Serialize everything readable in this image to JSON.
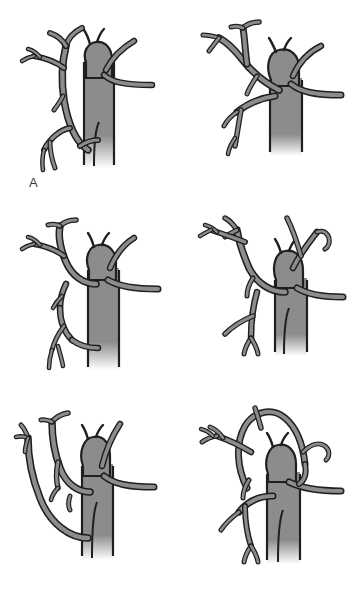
{
  "figure": {
    "background_color": "#ffffff",
    "panel_count": 6,
    "layout": "2 columns x 3 rows",
    "width": 349,
    "height": 590
  },
  "style": {
    "vessel_fill": "#8c8c8c",
    "vessel_outline": "#1f1f1f",
    "trunk_fill": "#8c8c8c",
    "label_color": "#3a3a3a",
    "outline_width": 2.2
  },
  "panels": [
    {
      "id": "panel-a",
      "label": "A",
      "description": "Vertical aortic trunk at right with bulbous arch head; left-sided branching vessel tree with multiple fine distal twigs; short horizontal branch crossing to the right margin."
    },
    {
      "id": "panel-b",
      "label": "B",
      "description": "Wide aortic arch with central head; long horizontal branch extending to right edge; left vessel tree sweeping upward and laterally with bifurcating tips."
    },
    {
      "id": "panel-c",
      "label": "C",
      "description": "Arch head with paired superior horns; left tree with tall vertical limb and lower descending branch crossing the trunk; right horizontal branch to margin."
    },
    {
      "id": "panel-d",
      "label": "D",
      "description": "Arch head with branch arising high and curving right; left tree with upper fan of fine twigs and lower descending limb; horizontal branch to right margin."
    },
    {
      "id": "panel-e",
      "label": "E",
      "description": "Long sweeping vessel descending from upper left to the trunk base; arch head with superior horns; right horizontal branch to margin."
    },
    {
      "id": "panel-f",
      "label": "F",
      "description": "Closed vascular loop arching over the aortic head; left tree with fine twigs; right branch curving down to horizontal branch at margin."
    }
  ]
}
